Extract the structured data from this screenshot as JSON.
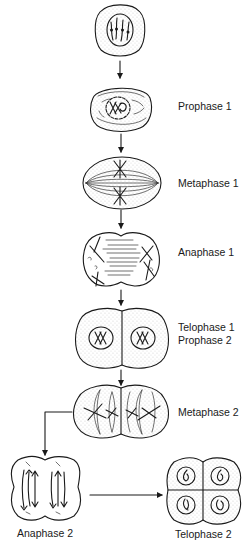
{
  "diagram": {
    "type": "meiosis-flow",
    "stages": [
      {
        "id": "interphase",
        "label": ""
      },
      {
        "id": "prophase1",
        "label": "Prophase 1"
      },
      {
        "id": "metaphase1",
        "label": "Metaphase 1"
      },
      {
        "id": "anaphase1",
        "label": "Anaphase 1"
      },
      {
        "id": "telophase1",
        "label": "Telophase 1",
        "label2": "Prophase 2"
      },
      {
        "id": "metaphase2",
        "label": "Metaphase 2"
      },
      {
        "id": "anaphase2",
        "label": "Anaphase 2"
      },
      {
        "id": "telophase2",
        "label": "Telophase 2"
      }
    ],
    "arrows": [
      {
        "from": "interphase",
        "to": "prophase1"
      },
      {
        "from": "prophase1",
        "to": "metaphase1"
      },
      {
        "from": "metaphase1",
        "to": "anaphase1"
      },
      {
        "from": "anaphase1",
        "to": "telophase1"
      },
      {
        "from": "telophase1",
        "to": "metaphase2"
      },
      {
        "from": "metaphase2",
        "to": "anaphase2"
      },
      {
        "from": "anaphase2",
        "to": "telophase2"
      }
    ],
    "colors": {
      "ink": "#1a1a1a",
      "background": "#ffffff",
      "stipple": "#555555"
    }
  }
}
